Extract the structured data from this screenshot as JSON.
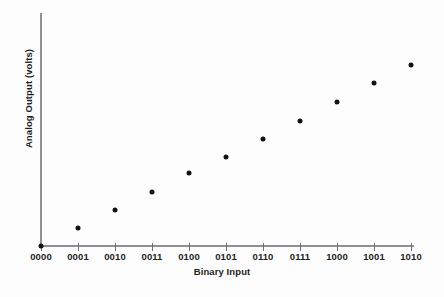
{
  "chart_data": {
    "type": "scatter",
    "title": "",
    "xlabel": "Binary Input",
    "ylabel": "Analog Output (volts)",
    "categories": [
      "0000",
      "0001",
      "0010",
      "0011",
      "0100",
      "0101",
      "0110",
      "0111",
      "1000",
      "1001",
      "1010"
    ],
    "x": [
      0,
      1,
      2,
      3,
      4,
      5,
      6,
      7,
      8,
      9,
      10
    ],
    "values": [
      0,
      1,
      2,
      3,
      4,
      5,
      6,
      7,
      8,
      9,
      10
    ],
    "xlim": [
      0,
      10
    ],
    "ylim": [
      0,
      11
    ],
    "grid": false,
    "legend": null,
    "series": [
      {
        "name": "Analog Output",
        "marker": "filled-circle",
        "color": "#121212",
        "values": [
          0,
          1,
          2,
          3,
          4,
          5,
          6,
          7,
          8,
          9,
          10
        ]
      }
    ],
    "points": [
      {
        "label": "0000",
        "x": 0,
        "y": 0,
        "px": 41,
        "py": 246
      },
      {
        "label": "0001",
        "x": 1,
        "y": 1,
        "px": 78,
        "py": 228
      },
      {
        "label": "0010",
        "x": 2,
        "y": 2,
        "px": 115,
        "py": 210
      },
      {
        "label": "0011",
        "x": 3,
        "y": 3,
        "px": 152,
        "py": 192
      },
      {
        "label": "0100",
        "x": 4,
        "y": 4,
        "px": 189,
        "py": 173
      },
      {
        "label": "0101",
        "x": 5,
        "y": 5,
        "px": 226,
        "py": 157
      },
      {
        "label": "0110",
        "x": 6,
        "y": 6,
        "px": 263,
        "py": 139
      },
      {
        "label": "0111",
        "x": 7,
        "y": 7,
        "px": 300,
        "py": 121
      },
      {
        "label": "1000",
        "x": 8,
        "y": 8,
        "px": 337,
        "py": 102
      },
      {
        "label": "1001",
        "x": 9,
        "y": 9,
        "px": 374,
        "py": 83
      },
      {
        "label": "1010",
        "x": 10,
        "y": 10,
        "px": 411,
        "py": 65
      }
    ],
    "axes": {
      "y_axis_color": "#8e9094",
      "x_axis_color": "#8e9094",
      "tick_color": "#6f7176",
      "marker_color": "#121212",
      "background": "#fdfdfd",
      "y_axis_has_ticks": false,
      "y_axis_has_tick_labels": false
    }
  }
}
